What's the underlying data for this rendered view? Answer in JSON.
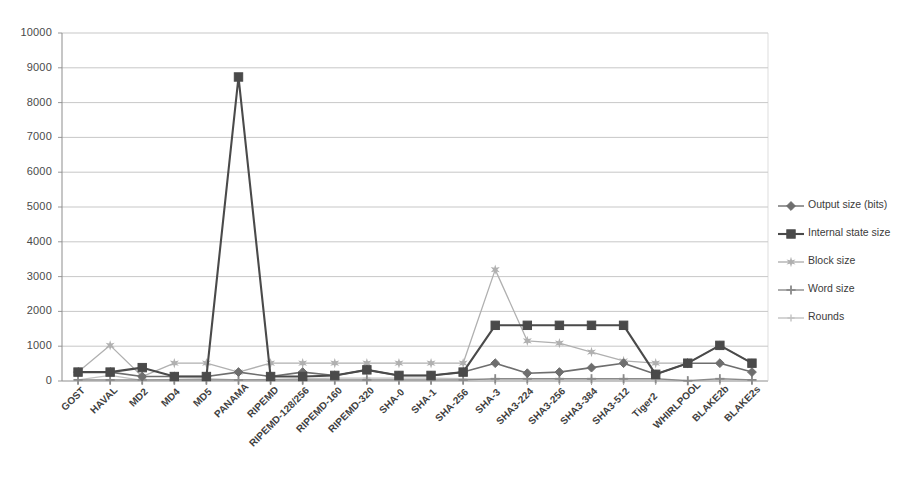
{
  "chart_data": {
    "type": "line",
    "title": "",
    "xlabel": "",
    "ylabel": "",
    "ylim": [
      0,
      10000
    ],
    "ytick_step": 1000,
    "grid": true,
    "legend_position": "right",
    "categories": [
      "GOST",
      "HAVAL",
      "MD2",
      "MD4",
      "MD5",
      "PANAMA",
      "RIPEMD",
      "RIPEMD-128/256",
      "RIPEMD-160",
      "RIPEMD-320",
      "SHA-0",
      "SHA-1",
      "SHA-256",
      "SHA-3",
      "SHA3-224",
      "SHA3-256",
      "SHA3-384",
      "SHA3-512",
      "Tiger2",
      "WHIRLPOOL",
      "BLAKE2b",
      "BLAKE2s"
    ],
    "yticks": [
      "0",
      "1000",
      "2000",
      "3000",
      "4000",
      "5000",
      "6000",
      "7000",
      "8000",
      "9000",
      "10000"
    ],
    "series": [
      {
        "name": "Output size (bits)",
        "marker": "diamond",
        "color": "#6e6e6e",
        "values": [
          256,
          256,
          128,
          128,
          128,
          256,
          128,
          256,
          160,
          320,
          160,
          160,
          256,
          512,
          224,
          256,
          384,
          512,
          192,
          512,
          512,
          256
        ]
      },
      {
        "name": "Internal state size",
        "marker": "square",
        "color": "#4a4a4a",
        "values": [
          256,
          256,
          384,
          128,
          128,
          8736,
          128,
          128,
          160,
          320,
          160,
          160,
          256,
          1600,
          1600,
          1600,
          1600,
          1600,
          192,
          512,
          1024,
          512
        ]
      },
      {
        "name": "Block size",
        "marker": "star",
        "color": "#b0b0b0",
        "values": [
          256,
          1024,
          128,
          512,
          512,
          256,
          512,
          512,
          512,
          512,
          512,
          512,
          512,
          3200,
          1152,
          1088,
          832,
          576,
          512,
          512,
          1024,
          512
        ]
      },
      {
        "name": "Word size",
        "marker": "plus",
        "color": "#8a8a8a",
        "values": [
          32,
          32,
          32,
          32,
          32,
          32,
          32,
          32,
          32,
          32,
          32,
          32,
          32,
          64,
          64,
          64,
          64,
          64,
          64,
          8,
          64,
          32
        ]
      },
      {
        "name": "Rounds",
        "marker": "plus-small",
        "color": "#c2c2c2",
        "values": [
          32,
          160,
          18,
          48,
          64,
          32,
          48,
          64,
          80,
          80,
          80,
          80,
          64,
          24,
          24,
          24,
          24,
          24,
          24,
          10,
          12,
          10
        ]
      }
    ]
  },
  "axis": {
    "y_max_label": "10000",
    "y_min_label": "0"
  }
}
